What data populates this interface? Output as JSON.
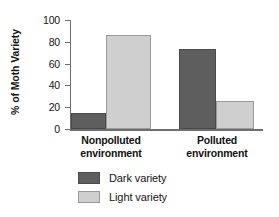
{
  "chart_data": {
    "type": "bar",
    "title": "",
    "xlabel": "",
    "ylabel": "% of Moth Variety",
    "ylim": [
      0,
      100
    ],
    "yticks": [
      0,
      20,
      40,
      60,
      80,
      100
    ],
    "ytick_labels": [
      "0",
      "20",
      "40",
      "60",
      "80",
      "100"
    ],
    "grid": false,
    "legend_position": "bottom-center",
    "categories": [
      "Nonpolluted environment",
      "Polluted environment"
    ],
    "category_lines": [
      {
        "line1": "Nonpolluted",
        "line2": "environment"
      },
      {
        "line1": "Polluted",
        "line2": "environment"
      }
    ],
    "series": [
      {
        "name": "Dark variety",
        "color": "#5e5e5e",
        "values": [
          15,
          73
        ]
      },
      {
        "name": "Light variety",
        "color": "#cfcfcf",
        "values": [
          86,
          26
        ]
      }
    ]
  },
  "legend": {
    "items": [
      {
        "label": "Dark variety",
        "swatch": "dark"
      },
      {
        "label": "Light variety",
        "swatch": "light"
      }
    ]
  },
  "colors": {
    "dark_variety": "#5e5e5e",
    "light_variety": "#cfcfcf",
    "axis": "#6e6e6e",
    "text": "#141414",
    "background": "#ffffff"
  }
}
